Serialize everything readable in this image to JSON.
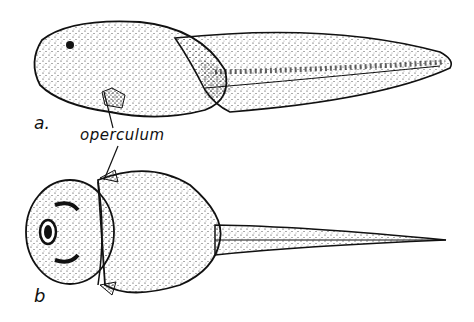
{
  "figure": {
    "labels": {
      "a": "a.",
      "operculum": "operculum",
      "b": "b"
    },
    "subjects": [
      {
        "id": "a",
        "view": "lateral view of tadpole"
      },
      {
        "id": "b",
        "view": "dorsal view of tadpole"
      }
    ],
    "colors": {
      "ink": "#111111",
      "background": "#ffffff"
    }
  }
}
